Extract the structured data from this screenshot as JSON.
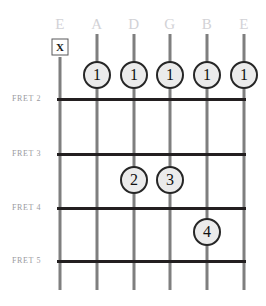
{
  "diagram": {
    "width": 266,
    "height": 306,
    "background_color": "#ffffff",
    "string_color": "#7f7f7f",
    "fret_color": "#231f20",
    "label_color": "#d2d2d6",
    "fret_label_color": "#9a9aa0",
    "dot_fill_color": "#ebebeb",
    "dot_border_color": "#262626",
    "dot_text_color": "#111111"
  },
  "strings": [
    {
      "label": "E",
      "x": 60,
      "label_y": 24,
      "top": 57,
      "bottom": 290
    },
    {
      "label": "A",
      "x": 97,
      "label_y": 24,
      "top": 34,
      "bottom": 290
    },
    {
      "label": "D",
      "x": 134,
      "label_y": 24,
      "top": 34,
      "bottom": 290
    },
    {
      "label": "G",
      "x": 170,
      "label_y": 24,
      "top": 34,
      "bottom": 290
    },
    {
      "label": "B",
      "x": 207,
      "label_y": 24,
      "top": 34,
      "bottom": 290
    },
    {
      "label": "E",
      "x": 244,
      "label_y": 24,
      "top": 34,
      "bottom": 290
    }
  ],
  "frets": [
    {
      "label": "FRET 2",
      "y": 98,
      "label_x": 12,
      "left": 57,
      "right": 246
    },
    {
      "label": "FRET 3",
      "y": 153,
      "label_x": 12,
      "left": 57,
      "right": 246
    },
    {
      "label": "FRET 4",
      "y": 207,
      "label_x": 12,
      "left": 57,
      "right": 246
    },
    {
      "label": "FRET 5",
      "y": 260,
      "label_x": 12,
      "left": 57,
      "right": 246
    }
  ],
  "markers": [
    {
      "type": "mute",
      "symbol": "X",
      "string": "E-low",
      "x": 60,
      "y": 47
    }
  ],
  "finger_dots": [
    {
      "finger": "1",
      "string": "A",
      "x": 97,
      "y": 75
    },
    {
      "finger": "1",
      "string": "D",
      "x": 134,
      "y": 75
    },
    {
      "finger": "1",
      "string": "G",
      "x": 170,
      "y": 75
    },
    {
      "finger": "1",
      "string": "B",
      "x": 207,
      "y": 75
    },
    {
      "finger": "1",
      "string": "E-high",
      "x": 244,
      "y": 75
    },
    {
      "finger": "2",
      "string": "D",
      "x": 134,
      "y": 180
    },
    {
      "finger": "3",
      "string": "G",
      "x": 170,
      "y": 180
    },
    {
      "finger": "4",
      "string": "B",
      "x": 207,
      "y": 232
    }
  ]
}
